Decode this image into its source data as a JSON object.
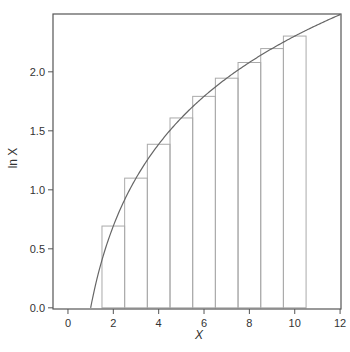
{
  "chart_data": {
    "type": "bar",
    "title": "",
    "xlabel": "X",
    "ylabel": "ln X",
    "xlim": [
      -0.66,
      12.04
    ],
    "ylim": [
      -0.01,
      2.49
    ],
    "grid": false,
    "legend": null,
    "x_ticks": [
      0,
      2,
      4,
      6,
      8,
      10,
      12
    ],
    "x_tick_labels": [
      "0",
      "2",
      "4",
      "6",
      "8",
      "10",
      "12"
    ],
    "y_ticks": [
      0.0,
      0.5,
      1.0,
      1.5,
      2.0
    ],
    "y_tick_labels": [
      "0.0",
      "0.5",
      "1.0",
      "1.5",
      "2.0"
    ],
    "bars": {
      "name": "ln n rectangles (width 1, centered at n)",
      "categories": [
        2,
        3,
        4,
        5,
        6,
        7,
        8,
        9,
        10
      ],
      "values": [
        0.693,
        1.099,
        1.386,
        1.609,
        1.792,
        1.946,
        2.079,
        2.197,
        2.303
      ],
      "width": 1.0
    },
    "curve": {
      "name": "ln x",
      "function": "ln(x)",
      "x_range": [
        1,
        12
      ]
    }
  },
  "colors": {
    "axis": "#555555",
    "bar_edge": "#aaaaaa",
    "curve": "#666666",
    "text": "#333333"
  }
}
